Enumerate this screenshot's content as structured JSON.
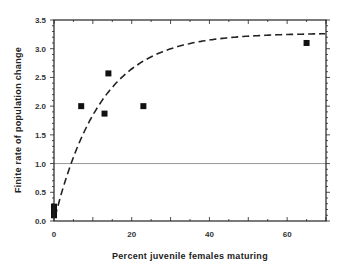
{
  "chart_data": {
    "type": "scatter",
    "title": "",
    "xlabel": "Percent juvenile females maturing",
    "ylabel": "Finite rate of population change",
    "xlim": [
      0,
      70
    ],
    "ylim": [
      0,
      3.5
    ],
    "xticks": [
      0,
      20,
      40,
      60
    ],
    "xtick_labels": [
      "0",
      "20",
      "40",
      "60"
    ],
    "yticks": [
      0.0,
      0.5,
      1.0,
      1.5,
      2.0,
      2.5,
      3.0,
      3.5
    ],
    "ytick_labels": [
      "0.0",
      "0.5",
      "1.0",
      "1.5",
      "2.0",
      "2.5",
      "3.0",
      "3.5"
    ],
    "grid": false,
    "legend": null,
    "series": [
      {
        "name": "observed",
        "marker": "square",
        "color": "#111111",
        "points": [
          {
            "x": 0,
            "y": 0.1
          },
          {
            "x": 0,
            "y": 0.15
          },
          {
            "x": 0,
            "y": 0.2
          },
          {
            "x": 0,
            "y": 0.25
          },
          {
            "x": 7,
            "y": 2.0
          },
          {
            "x": 13,
            "y": 1.87
          },
          {
            "x": 14,
            "y": 2.57
          },
          {
            "x": 23,
            "y": 2.0
          },
          {
            "x": 65,
            "y": 3.1
          }
        ]
      },
      {
        "name": "fitted curve",
        "style": "dashed",
        "color": "#222222",
        "model": "y = 3.27 * (1 - exp(-0.083 * x))",
        "asymptote": 3.27,
        "rate": 0.083
      }
    ],
    "reference_lines": [
      {
        "orientation": "horizontal",
        "y": 1.0,
        "color": "#999999"
      }
    ]
  }
}
